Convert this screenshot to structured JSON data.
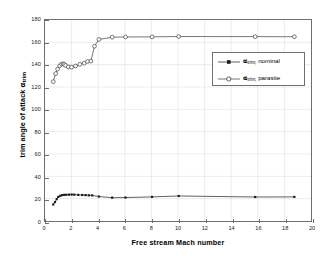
{
  "chart_data": {
    "type": "line",
    "title": "",
    "xlabel": "Free stream Mach number",
    "ylabel": "trim angle of attack αtrim",
    "ylabel_main": "trim angle of attack ",
    "ylabel_symbol": "α",
    "ylabel_sub": "trim",
    "xlim": [
      0,
      20
    ],
    "ylim": [
      0,
      180
    ],
    "xticks": [
      0,
      2,
      4,
      6,
      8,
      10,
      12,
      14,
      16,
      18,
      20
    ],
    "yticks": [
      0,
      20,
      40,
      60,
      80,
      100,
      120,
      140,
      160,
      180
    ],
    "xtick_labels": [
      "0",
      "2",
      "4",
      "6",
      "8",
      "10",
      "12",
      "14",
      "16",
      "18",
      "20"
    ],
    "ytick_labels": [
      "0",
      "20",
      "40",
      "60",
      "80",
      "100",
      "120",
      "140",
      "160",
      "180"
    ],
    "grid": true,
    "legend_position": "right-upper-inside",
    "series": [
      {
        "name": "alpha_trim_nominal",
        "legend_symbol": "α",
        "legend_sub": "trim;",
        "legend_suffix": " nominal",
        "legend_label": "αtrim; nominal",
        "marker": "filled-square",
        "color": "#1a1a1a",
        "x": [
          0.62,
          0.75,
          0.88,
          1.0,
          1.15,
          1.3,
          1.45,
          1.6,
          1.8,
          2.0,
          2.2,
          2.5,
          2.8,
          3.05,
          3.3,
          3.55,
          4.05,
          5.05,
          6.05,
          8.05,
          10.05,
          15.8,
          18.75
        ],
        "y": [
          14.8,
          17.0,
          19.6,
          21.6,
          22.6,
          23.2,
          23.4,
          23.5,
          23.6,
          23.7,
          23.6,
          23.4,
          23.3,
          23.2,
          23.0,
          22.9,
          21.9,
          20.9,
          21.0,
          21.6,
          22.4,
          21.5,
          21.6
        ]
      },
      {
        "name": "alpha_trim_parasite",
        "legend_symbol": "α",
        "legend_sub": "trim;",
        "legend_suffix": " parasite",
        "legend_label": "αtrim; parasite",
        "marker": "open-circle",
        "color": "#3c3c3c",
        "x": [
          0.62,
          0.8,
          0.95,
          1.1,
          1.25,
          1.38,
          1.45,
          1.55,
          1.75,
          2.0,
          2.3,
          2.62,
          2.95,
          3.2,
          3.45,
          3.72,
          4.05,
          5.05,
          6.05,
          8.05,
          10.05,
          15.8,
          18.75
        ],
        "y": [
          124.8,
          132.0,
          136.0,
          139.0,
          140.5,
          140.8,
          140.2,
          139.3,
          138.0,
          137.8,
          138.8,
          140.3,
          141.3,
          142.8,
          143.2,
          156.5,
          162.6,
          164.6,
          164.8,
          164.9,
          165.2,
          165.1,
          165.0
        ]
      }
    ]
  }
}
